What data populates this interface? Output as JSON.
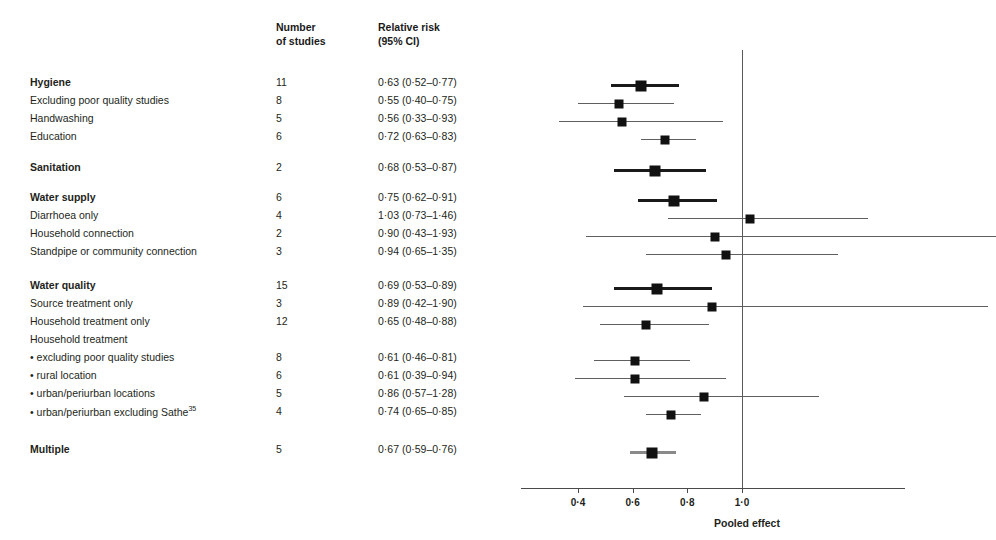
{
  "columns": {
    "label_header": "",
    "number_header_line1": "Number",
    "number_header_line2": "of studies",
    "rr_header_line1": "Relative risk",
    "rr_header_line2": "(95% CI)"
  },
  "axis": {
    "title": "Pooled effect",
    "ticks": [
      "0·4",
      "0·6",
      "0·8",
      "1·0"
    ],
    "tick_values": [
      0.4,
      0.6,
      0.8,
      1.0
    ],
    "reference_line": 1.0,
    "xmin": 0.3,
    "xmax": 2.0
  },
  "chart_data": {
    "type": "forest",
    "title": "",
    "xlabel": "Pooled effect",
    "ylabel": "",
    "xlim": [
      0.3,
      2.0
    ],
    "xticks": [
      0.4,
      0.6,
      0.8,
      1.0
    ],
    "xticklabels": [
      "0·4",
      "0·6",
      "0·8",
      "1·0"
    ],
    "reference_line": 1.0,
    "grid": false,
    "legend": "none",
    "columns": [
      "Number of studies",
      "Relative risk (95% CI)"
    ],
    "rows": [
      {
        "label": "Hygiene",
        "bold": true,
        "summary": true,
        "studies": "11",
        "rr_text": "0·63 (0·52–0·77)",
        "rr": 0.63,
        "lo": 0.52,
        "hi": 0.77
      },
      {
        "label": "Excluding poor quality studies",
        "bold": false,
        "summary": false,
        "studies": "8",
        "rr_text": "0·55 (0·40–0·75)",
        "rr": 0.55,
        "lo": 0.4,
        "hi": 0.75
      },
      {
        "label": "Handwashing",
        "bold": false,
        "summary": false,
        "studies": "5",
        "rr_text": "0·56 (0·33–0·93)",
        "rr": 0.56,
        "lo": 0.33,
        "hi": 0.93
      },
      {
        "label": "Education",
        "bold": false,
        "summary": false,
        "studies": "6",
        "rr_text": "0·72 (0·63–0·83)",
        "rr": 0.72,
        "lo": 0.63,
        "hi": 0.83
      },
      {
        "label": "Sanitation",
        "bold": true,
        "summary": true,
        "studies": "2",
        "rr_text": "0·68 (0·53–0·87)",
        "rr": 0.68,
        "lo": 0.53,
        "hi": 0.87
      },
      {
        "label": "Water supply",
        "bold": true,
        "summary": true,
        "studies": "6",
        "rr_text": "0·75 (0·62–0·91)",
        "rr": 0.75,
        "lo": 0.62,
        "hi": 0.91
      },
      {
        "label": "Diarrhoea only",
        "bold": false,
        "summary": false,
        "studies": "4",
        "rr_text": "1·03 (0·73–1·46)",
        "rr": 1.03,
        "lo": 0.73,
        "hi": 1.46
      },
      {
        "label": "Household connection",
        "bold": false,
        "summary": false,
        "studies": "2",
        "rr_text": "0·90 (0·43–1·93)",
        "rr": 0.9,
        "lo": 0.43,
        "hi": 1.93
      },
      {
        "label": "Standpipe or community connection",
        "bold": false,
        "summary": false,
        "studies": "3",
        "rr_text": "0·94 (0·65–1·35)",
        "rr": 0.94,
        "lo": 0.65,
        "hi": 1.35
      },
      {
        "label": "Water quality",
        "bold": true,
        "summary": true,
        "studies": "15",
        "rr_text": "0·69 (0·53–0·89)",
        "rr": 0.69,
        "lo": 0.53,
        "hi": 0.89
      },
      {
        "label": "Source treatment only",
        "bold": false,
        "summary": false,
        "studies": "3",
        "rr_text": "0·89 (0·42–1·90)",
        "rr": 0.89,
        "lo": 0.42,
        "hi": 1.9
      },
      {
        "label": "Household treatment only",
        "bold": false,
        "summary": false,
        "studies": "12",
        "rr_text": "0·65 (0·48–0·88)",
        "rr": 0.65,
        "lo": 0.48,
        "hi": 0.88
      },
      {
        "label": "Household treatment",
        "bold": false,
        "summary": false,
        "studies": "",
        "rr_text": "",
        "rr": null,
        "lo": null,
        "hi": null
      },
      {
        "label": "• excluding poor quality studies",
        "bold": false,
        "summary": false,
        "studies": "8",
        "rr_text": "0·61 (0·46–0·81)",
        "rr": 0.61,
        "lo": 0.46,
        "hi": 0.81
      },
      {
        "label": "• rural location",
        "bold": false,
        "summary": false,
        "studies": "6",
        "rr_text": "0·61 (0·39–0·94)",
        "rr": 0.61,
        "lo": 0.39,
        "hi": 0.94
      },
      {
        "label": "• urban/periurban locations",
        "bold": false,
        "summary": false,
        "studies": "5",
        "rr_text": "0·86 (0·57–1·28)",
        "rr": 0.86,
        "lo": 0.57,
        "hi": 1.28
      },
      {
        "label": "• urban/periurban excluding Sathe",
        "label_sup": "35",
        "bold": false,
        "summary": false,
        "studies": "4",
        "rr_text": "0·74 (0·65–0·85)",
        "rr": 0.74,
        "lo": 0.65,
        "hi": 0.85
      },
      {
        "label": "Multiple",
        "bold": true,
        "summary": true,
        "grey": true,
        "studies": "5",
        "rr_text": "0·67 (0·59–0·76)",
        "rr": 0.67,
        "lo": 0.59,
        "hi": 0.76
      }
    ]
  }
}
